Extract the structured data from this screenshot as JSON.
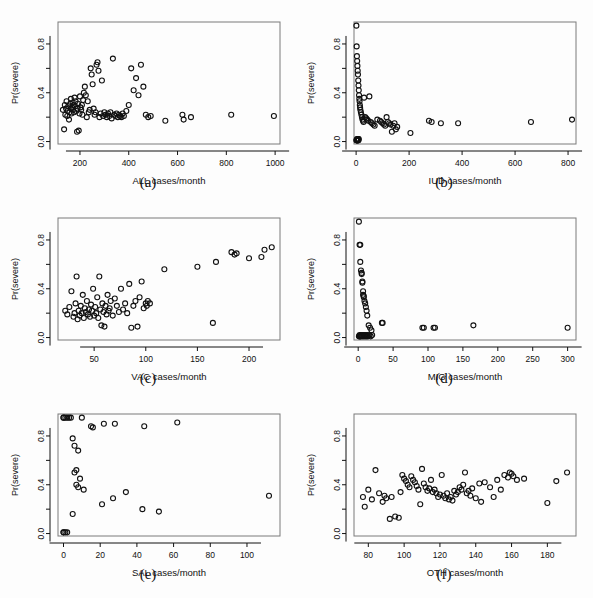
{
  "figure": {
    "title": "",
    "panel_count": 6,
    "shared_ylabel": "Pr(severe)",
    "y_ticks": [
      "0.0",
      "0.4",
      "0.8"
    ],
    "y_tick_values": [
      0.0,
      0.4,
      0.8
    ],
    "ylim": [
      -0.02,
      0.98
    ]
  },
  "chart_data": [
    {
      "type": "scatter",
      "panel": "a",
      "caption": "(a)",
      "title": "",
      "xlabel": "ALL cases/month",
      "ylabel": "Pr(severe)",
      "xlim": [
        110,
        1020
      ],
      "ylim": [
        -0.02,
        0.98
      ],
      "xticks": [
        200,
        400,
        600,
        800,
        1000
      ],
      "xtick_labels": [
        "200",
        "400",
        "600",
        "800",
        "1000"
      ],
      "yticks": [
        0.0,
        0.4,
        0.8
      ],
      "ytick_labels": [
        "0.0",
        "0.4",
        "0.8"
      ],
      "grid": false,
      "legend": "none",
      "marker": "open-circle",
      "x": [
        130,
        135,
        138,
        140,
        143,
        145,
        148,
        150,
        152,
        155,
        157,
        160,
        162,
        163,
        165,
        168,
        170,
        172,
        174,
        176,
        178,
        180,
        182,
        185,
        188,
        190,
        192,
        195,
        198,
        200,
        202,
        205,
        208,
        210,
        213,
        216,
        220,
        224,
        228,
        232,
        236,
        240,
        244,
        248,
        252,
        256,
        260,
        264,
        268,
        272,
        276,
        280,
        285,
        290,
        295,
        300,
        305,
        310,
        315,
        320,
        325,
        330,
        335,
        340,
        345,
        350,
        355,
        360,
        365,
        370,
        375,
        380,
        390,
        400,
        410,
        420,
        430,
        440,
        450,
        460,
        470,
        480,
        490,
        550,
        620,
        625,
        655,
        820,
        995
      ],
      "y": [
        0.26,
        0.1,
        0.3,
        0.22,
        0.27,
        0.33,
        0.21,
        0.25,
        0.29,
        0.18,
        0.24,
        0.31,
        0.27,
        0.35,
        0.23,
        0.28,
        0.32,
        0.26,
        0.3,
        0.24,
        0.36,
        0.29,
        0.33,
        0.25,
        0.08,
        0.27,
        0.31,
        0.09,
        0.23,
        0.37,
        0.28,
        0.26,
        0.3,
        0.22,
        0.34,
        0.4,
        0.45,
        0.38,
        0.2,
        0.33,
        0.24,
        0.26,
        0.6,
        0.55,
        0.47,
        0.27,
        0.22,
        0.24,
        0.63,
        0.65,
        0.58,
        0.2,
        0.23,
        0.5,
        0.21,
        0.24,
        0.22,
        0.2,
        0.23,
        0.21,
        0.24,
        0.19,
        0.68,
        0.22,
        0.21,
        0.23,
        0.2,
        0.22,
        0.21,
        0.2,
        0.23,
        0.21,
        0.25,
        0.3,
        0.6,
        0.42,
        0.52,
        0.38,
        0.63,
        0.45,
        0.22,
        0.2,
        0.21,
        0.17,
        0.22,
        0.18,
        0.2,
        0.22,
        0.21
      ]
    },
    {
      "type": "scatter",
      "panel": "b",
      "caption": "(b)",
      "title": "",
      "xlabel": "IUD cases/month",
      "ylabel": "Pr(severe)",
      "xlim": [
        -8,
        830
      ],
      "ylim": [
        -0.02,
        0.98
      ],
      "xticks": [
        0,
        200,
        400,
        600,
        800
      ],
      "xtick_labels": [
        "0",
        "200",
        "400",
        "600",
        "800"
      ],
      "yticks": [
        0.0,
        0.4,
        0.8
      ],
      "ytick_labels": [
        "0.0",
        "0.4",
        "0.8"
      ],
      "grid": false,
      "legend": "none",
      "marker": "open-circle",
      "x": [
        1,
        1,
        2,
        2,
        3,
        3,
        4,
        4,
        5,
        5,
        6,
        6,
        7,
        7,
        8,
        8,
        9,
        9,
        10,
        10,
        11,
        12,
        13,
        14,
        15,
        16,
        18,
        20,
        22,
        24,
        26,
        28,
        30,
        34,
        38,
        42,
        46,
        50,
        55,
        60,
        65,
        70,
        80,
        90,
        95,
        100,
        105,
        110,
        115,
        120,
        125,
        130,
        135,
        140,
        145,
        150,
        155,
        205,
        275,
        285,
        320,
        385,
        660,
        815
      ],
      "y": [
        0.01,
        0.95,
        0.01,
        0.78,
        0.02,
        0.7,
        0.01,
        0.66,
        0.62,
        0.01,
        0.58,
        0.02,
        0.55,
        0.01,
        0.5,
        0.02,
        0.46,
        0.01,
        0.42,
        0.02,
        0.38,
        0.35,
        0.33,
        0.3,
        0.28,
        0.26,
        0.24,
        0.22,
        0.2,
        0.18,
        0.17,
        0.16,
        0.36,
        0.2,
        0.19,
        0.18,
        0.17,
        0.37,
        0.16,
        0.15,
        0.14,
        0.13,
        0.18,
        0.17,
        0.16,
        0.15,
        0.14,
        0.13,
        0.2,
        0.16,
        0.15,
        0.14,
        0.08,
        0.13,
        0.15,
        0.1,
        0.12,
        0.07,
        0.17,
        0.16,
        0.15,
        0.15,
        0.16,
        0.18
      ]
    },
    {
      "type": "scatter",
      "panel": "c",
      "caption": "(c)",
      "title": "",
      "xlabel": "VAC cases/month",
      "ylabel": "Pr(severe)",
      "xlim": [
        15,
        230
      ],
      "ylim": [
        -0.02,
        0.98
      ],
      "xticks": [
        50,
        100,
        150,
        200
      ],
      "xtick_labels": [
        "50",
        "100",
        "150",
        "200"
      ],
      "yticks": [
        0.0,
        0.4,
        0.8
      ],
      "ytick_labels": [
        "0.0",
        "0.4",
        "0.8"
      ],
      "grid": false,
      "legend": "none",
      "marker": "open-circle",
      "x": [
        22,
        24,
        26,
        28,
        30,
        31,
        32,
        33,
        34,
        35,
        36,
        37,
        38,
        39,
        40,
        41,
        42,
        43,
        44,
        45,
        46,
        47,
        48,
        49,
        50,
        51,
        52,
        53,
        54,
        55,
        56,
        57,
        58,
        59,
        60,
        61,
        62,
        63,
        64,
        65,
        66,
        68,
        70,
        72,
        74,
        76,
        78,
        80,
        82,
        84,
        86,
        88,
        90,
        92,
        94,
        96,
        98,
        100,
        101,
        102,
        104,
        118,
        150,
        165,
        168,
        183,
        186,
        188,
        200,
        212,
        215,
        222
      ],
      "y": [
        0.22,
        0.19,
        0.25,
        0.38,
        0.17,
        0.2,
        0.28,
        0.5,
        0.15,
        0.22,
        0.18,
        0.26,
        0.2,
        0.35,
        0.16,
        0.24,
        0.21,
        0.3,
        0.19,
        0.23,
        0.17,
        0.27,
        0.22,
        0.4,
        0.18,
        0.25,
        0.2,
        0.33,
        0.16,
        0.5,
        0.23,
        0.1,
        0.28,
        0.21,
        0.09,
        0.26,
        0.19,
        0.35,
        0.22,
        0.24,
        0.3,
        0.18,
        0.32,
        0.26,
        0.21,
        0.4,
        0.23,
        0.28,
        0.2,
        0.44,
        0.08,
        0.26,
        0.3,
        0.09,
        0.33,
        0.46,
        0.24,
        0.28,
        0.26,
        0.3,
        0.28,
        0.56,
        0.58,
        0.12,
        0.62,
        0.7,
        0.68,
        0.69,
        0.65,
        0.66,
        0.72,
        0.74
      ]
    },
    {
      "type": "scatter",
      "panel": "d",
      "caption": "(d)",
      "title": "",
      "xlabel": "MIG cases/month",
      "ylabel": "Pr(severe)",
      "xlim": [
        -6,
        312
      ],
      "ylim": [
        -0.02,
        0.98
      ],
      "xticks": [
        0,
        50,
        100,
        150,
        200,
        250,
        300
      ],
      "xtick_labels": [
        "0",
        "50",
        "100",
        "150",
        "200",
        "250",
        "300"
      ],
      "yticks": [
        0.0,
        0.4,
        0.8
      ],
      "ytick_labels": [
        "0.0",
        "0.4",
        "0.8"
      ],
      "grid": false,
      "legend": "none",
      "marker": "open-circle",
      "x": [
        1,
        1,
        2,
        2,
        2,
        3,
        3,
        3,
        4,
        4,
        4,
        5,
        5,
        5,
        6,
        6,
        6,
        7,
        7,
        7,
        8,
        8,
        8,
        9,
        9,
        10,
        10,
        11,
        11,
        12,
        12,
        13,
        13,
        14,
        15,
        16,
        17,
        18,
        19,
        20,
        34,
        35,
        92,
        94,
        108,
        110,
        165,
        300
      ],
      "y": [
        0.01,
        0.95,
        0.01,
        0.76,
        0.02,
        0.76,
        0.01,
        0.62,
        0.02,
        0.55,
        0.01,
        0.53,
        0.02,
        0.52,
        0.01,
        0.45,
        0.46,
        0.02,
        0.38,
        0.35,
        0.01,
        0.34,
        0.33,
        0.02,
        0.3,
        0.01,
        0.28,
        0.02,
        0.25,
        0.01,
        0.22,
        0.02,
        0.18,
        0.01,
        0.1,
        0.02,
        0.08,
        0.01,
        0.06,
        0.02,
        0.12,
        0.12,
        0.08,
        0.08,
        0.08,
        0.08,
        0.1,
        0.08
      ]
    },
    {
      "type": "scatter",
      "panel": "e",
      "caption": "(e)",
      "title": "",
      "xlabel": "SAL cases/month",
      "ylabel": "Pr(severe)",
      "xlim": [
        -3,
        118
      ],
      "ylim": [
        -0.02,
        0.98
      ],
      "xticks": [
        0,
        20,
        40,
        60,
        80,
        100
      ],
      "xtick_labels": [
        "0",
        "20",
        "40",
        "60",
        "80",
        "100"
      ],
      "yticks": [
        0.0,
        0.4,
        0.8
      ],
      "ytick_labels": [
        "0.0",
        "0.4",
        "0.8"
      ],
      "grid": false,
      "legend": "none",
      "marker": "open-circle",
      "x": [
        0,
        0,
        0,
        0,
        1,
        1,
        2,
        2,
        3,
        4,
        5,
        5,
        6,
        6,
        7,
        7,
        8,
        8,
        9,
        10,
        11,
        15,
        16,
        21,
        22,
        27,
        28,
        34,
        43,
        44,
        52,
        62,
        112
      ],
      "y": [
        0.01,
        0.01,
        0.95,
        0.95,
        0.95,
        0.01,
        0.95,
        0.01,
        0.95,
        0.95,
        0.78,
        0.16,
        0.72,
        0.5,
        0.52,
        0.4,
        0.68,
        0.38,
        0.45,
        0.95,
        0.36,
        0.88,
        0.87,
        0.24,
        0.9,
        0.29,
        0.9,
        0.34,
        0.2,
        0.88,
        0.18,
        0.91,
        0.31
      ]
    },
    {
      "type": "scatter",
      "panel": "f",
      "caption": "(f)",
      "title": "",
      "xlabel": "OTH cases/month",
      "ylabel": "Pr(severe)",
      "xlim": [
        72,
        196
      ],
      "ylim": [
        -0.02,
        0.98
      ],
      "xticks": [
        80,
        100,
        120,
        140,
        160,
        180
      ],
      "xtick_labels": [
        "80",
        "100",
        "120",
        "140",
        "160",
        "180"
      ],
      "yticks": [
        0.0,
        0.4,
        0.8
      ],
      "ytick_labels": [
        "0.0",
        "0.4",
        "0.8"
      ],
      "grid": false,
      "legend": "none",
      "marker": "open-circle",
      "x": [
        77,
        78,
        80,
        82,
        84,
        86,
        88,
        89,
        90,
        92,
        93,
        95,
        97,
        98,
        99,
        100,
        101,
        102,
        103,
        104,
        105,
        106,
        107,
        108,
        109,
        110,
        111,
        112,
        113,
        114,
        115,
        116,
        117,
        118,
        119,
        120,
        121,
        122,
        123,
        124,
        125,
        126,
        127,
        128,
        129,
        130,
        131,
        132,
        133,
        134,
        135,
        136,
        137,
        138,
        140,
        142,
        143,
        145,
        148,
        150,
        152,
        154,
        156,
        158,
        159,
        160,
        161,
        163,
        167,
        180,
        185,
        191
      ],
      "y": [
        0.3,
        0.22,
        0.36,
        0.28,
        0.52,
        0.33,
        0.26,
        0.31,
        0.29,
        0.12,
        0.3,
        0.14,
        0.13,
        0.34,
        0.48,
        0.45,
        0.43,
        0.4,
        0.38,
        0.47,
        0.44,
        0.42,
        0.39,
        0.36,
        0.24,
        0.53,
        0.41,
        0.38,
        0.35,
        0.37,
        0.44,
        0.34,
        0.36,
        0.33,
        0.3,
        0.32,
        0.48,
        0.31,
        0.29,
        0.33,
        0.28,
        0.3,
        0.27,
        0.35,
        0.32,
        0.34,
        0.38,
        0.36,
        0.4,
        0.5,
        0.33,
        0.35,
        0.31,
        0.37,
        0.29,
        0.41,
        0.26,
        0.42,
        0.38,
        0.3,
        0.44,
        0.36,
        0.48,
        0.46,
        0.5,
        0.49,
        0.47,
        0.44,
        0.45,
        0.25,
        0.43,
        0.5
      ]
    }
  ]
}
